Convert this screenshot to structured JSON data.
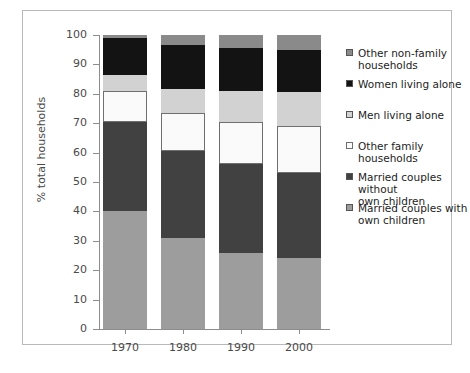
{
  "chart_data": {
    "type": "bar",
    "subtype": "stacked-bar-percent",
    "title": "",
    "xlabel": "",
    "ylabel": "% total households",
    "categories": [
      "1970",
      "1980",
      "1990",
      "2000"
    ],
    "ylim": [
      0,
      100
    ],
    "yticks": [
      0,
      10,
      20,
      30,
      40,
      50,
      60,
      70,
      80,
      90,
      100
    ],
    "ytick_labels": [
      "0",
      "10",
      "20",
      "30",
      "40",
      "50",
      "60",
      "70",
      "80",
      "90",
      "100"
    ],
    "grid": false,
    "legend_position": "right",
    "stack_order": "bottom-to-top",
    "series": [
      {
        "name": "Married couples with own children",
        "color": "#9d9d9d",
        "values": [
          40,
          31,
          26,
          24
        ]
      },
      {
        "name": "Married couples without own children",
        "color": "#414141",
        "values": [
          30.5,
          29.5,
          30,
          29
        ]
      },
      {
        "name": "Other family households",
        "color": "#fafafa",
        "values": [
          10.5,
          13,
          14.5,
          16
        ]
      },
      {
        "name": "Men living alone",
        "color": "#d2d2d2",
        "values": [
          5.5,
          8,
          10.5,
          11.5
        ]
      },
      {
        "name": "Women living alone",
        "color": "#131313",
        "values": [
          12.5,
          15,
          14.5,
          14.5
        ]
      },
      {
        "name": "Other non-family households",
        "color": "#8a8a8a",
        "values": [
          1,
          3.5,
          4.5,
          5
        ]
      }
    ]
  },
  "legend": {
    "entries": [
      {
        "label": "Other non-family\nhouseholds",
        "color": "#8a8a8a",
        "top": 0
      },
      {
        "label": "Women living alone",
        "color": "#131313",
        "top": 31
      },
      {
        "label": "Men living alone",
        "color": "#d2d2d2",
        "top": 62
      },
      {
        "label": "Other family households",
        "color": "#fafafa",
        "top": 93
      },
      {
        "label": "Married couples without\nown children",
        "color": "#414141",
        "top": 124
      },
      {
        "label": "Married couples with\nown children",
        "color": "#9d9d9d",
        "top": 155
      }
    ]
  },
  "caption": {
    "text": ""
  }
}
